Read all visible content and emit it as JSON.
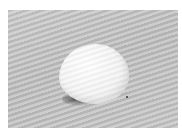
{
  "image": {
    "subject": "white pebble on grey textured surface",
    "alt": "A smooth white pebble resting on a grey wavy-textured surface with a dark shadow at its lower left",
    "colors": {
      "background": "#ffffff",
      "surface": "#c4c4c4",
      "pebble": "#f4f4f4",
      "shadow": "#2a2a2a"
    }
  }
}
